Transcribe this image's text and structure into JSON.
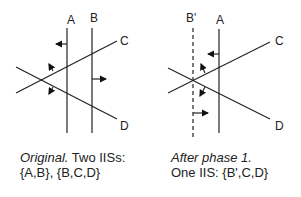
{
  "panels": [
    {
      "labels": {
        "a": "A",
        "b": "B",
        "c": "C",
        "d": "D"
      },
      "caption": {
        "italic": "Original.",
        "rest": " Two IISs:",
        "line2": "{A,B}, {B,C,D}"
      }
    },
    {
      "labels": {
        "b": "B'",
        "a": "A",
        "c": "C",
        "d": "D"
      },
      "caption": {
        "italic": "After phase 1.",
        "line2": "One IIS: {B',C,D}"
      }
    }
  ]
}
